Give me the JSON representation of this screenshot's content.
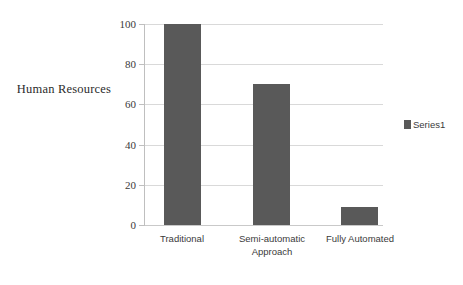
{
  "chart_data": {
    "type": "bar",
    "title": "",
    "subtitle": "",
    "xlabel": "",
    "ylabel": "Human Resources",
    "categories": [
      "Traditional",
      "Semi-automatic Approach",
      "Fully Automated"
    ],
    "values": [
      100,
      70,
      9
    ],
    "series": [
      {
        "name": "Series1",
        "values": [
          100,
          70,
          9
        ]
      }
    ],
    "ylim": [
      0,
      100
    ],
    "ytick_labels": [
      "0",
      "20",
      "40",
      "60",
      "80",
      "100"
    ],
    "ytick_values": [
      0,
      20,
      40,
      60,
      80,
      100
    ],
    "grid": true,
    "grid_axis": "y",
    "legend": {
      "position": "right",
      "entries": [
        "Series1"
      ]
    },
    "colors": {
      "bar": "#595959",
      "gridline": "#d9d9d9",
      "axis": "#bfbfbf",
      "text": "#3a3a3a",
      "background": "#ffffff"
    }
  },
  "axis_title": {
    "text": "Human Resources"
  },
  "legend": {
    "items": [
      {
        "label": "Series1",
        "color": "#595959"
      }
    ]
  },
  "categories": [
    {
      "line1": "Traditional",
      "line2": ""
    },
    {
      "line1": "Semi-automatic",
      "line2": "Approach"
    },
    {
      "line1": "Fully Automated",
      "line2": ""
    }
  ],
  "y_axis": {
    "ticks": [
      {
        "label": "100"
      },
      {
        "label": "80"
      },
      {
        "label": "60"
      },
      {
        "label": "40"
      },
      {
        "label": "20"
      },
      {
        "label": "0"
      }
    ]
  }
}
